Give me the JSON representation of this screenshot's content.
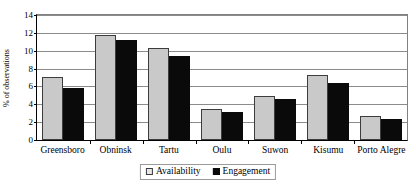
{
  "chart_data": {
    "type": "bar",
    "title": "",
    "subtitle": "",
    "xlabel": "",
    "ylabel": "% of observations",
    "ylim": [
      0,
      14
    ],
    "ytick_step": 2,
    "yticks": [
      0,
      2,
      4,
      6,
      8,
      10,
      12,
      14
    ],
    "ytick_labels": [
      "0",
      "2",
      "4",
      "6",
      "8",
      "10",
      "12",
      "14"
    ],
    "grid": true,
    "grid_axis": "y",
    "legend_position": "bottom-center",
    "categories": [
      "Greensboro",
      "Obninsk",
      "Tartu",
      "Oulu",
      "Suwon",
      "Kisumu",
      "Porto Alegre"
    ],
    "series": [
      {
        "name": "Availability",
        "color": "#c9c9c9",
        "values": [
          6.9,
          11.6,
          10.1,
          3.45,
          4.9,
          7.15,
          2.6
        ]
      },
      {
        "name": "Engagement",
        "color": "#0a0a0a",
        "values": [
          5.7,
          11.0,
          9.3,
          3.1,
          4.5,
          6.3,
          2.35
        ]
      }
    ],
    "annotations": []
  },
  "legend": {
    "items": [
      {
        "label": "Availability"
      },
      {
        "label": "Engagement"
      }
    ]
  }
}
